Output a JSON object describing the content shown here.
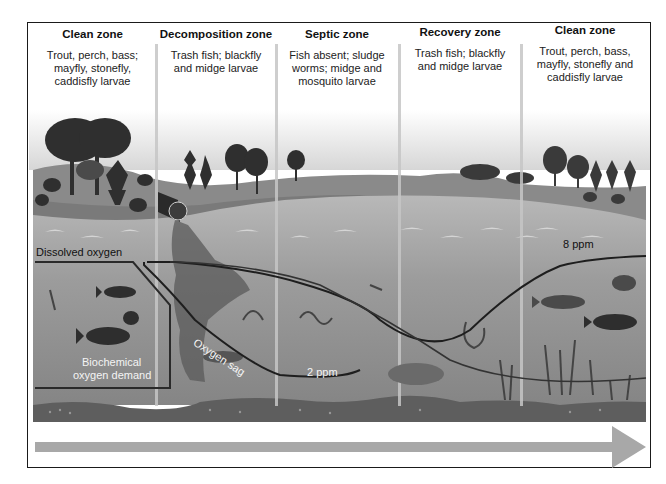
{
  "diagram": {
    "zones": [
      {
        "title": "Clean zone",
        "description_lines": [
          "Trout, perch, bass;",
          "mayfly, stonefly,",
          "caddisfly larvae"
        ]
      },
      {
        "title": "Decomposition zone",
        "description_lines": [
          "Trash fish; blackfly",
          "and midge larvae"
        ]
      },
      {
        "title": "Septic zone",
        "description_lines": [
          "Fish absent; sludge",
          "worms; midge and",
          "mosquito larvae"
        ]
      },
      {
        "title": "Recovery zone",
        "description_lines": [
          "Trash fish; blackfly",
          "and midge larvae"
        ]
      },
      {
        "title": "Clean zone",
        "description_lines": [
          "Trout, perch, bass,",
          "mayfly, stonefly and",
          "caddisfly larvae"
        ]
      }
    ],
    "labels": {
      "dissolved_oxygen": "Dissolved oxygen",
      "oxygen_sag": "Oxygen sag",
      "bod_line1": "Biochemical",
      "bod_line2": "oxygen demand",
      "low_do": "2 ppm",
      "high_do": "8 ppm"
    },
    "flow_arrow": "direction-of-flow-arrow",
    "colors": {
      "sky_top": "#ffffff",
      "hill": "#8a8a8a",
      "water": "#9a9a9a",
      "riverbed": "#5e5e5e",
      "curve": "#1e1e1e",
      "arrow": "#a8a8a8"
    }
  }
}
